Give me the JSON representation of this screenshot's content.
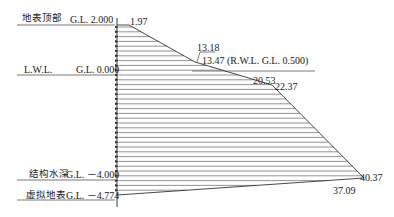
{
  "levels": [
    {
      "name": "地表顶部",
      "elevation": "G.L. 2.000"
    },
    {
      "name": "L.W.L.",
      "elevation": "G.L. 0.000"
    },
    {
      "name": "结构水深",
      "elevation": "G.L. －4.000"
    },
    {
      "name": "虚拟地表",
      "elevation": "G.L. －4.774"
    }
  ],
  "values": {
    "top": "1.97",
    "rwl_upper": "13.18",
    "rwl_lower": "13.47 (R.W.L.  G.L.  0.500)",
    "kink_left": "20.53",
    "kink_right": "22.37",
    "bottom_right": "40.37",
    "bottom_base": "37.09"
  },
  "colors": {
    "line": "#444444",
    "text": "#222222"
  }
}
